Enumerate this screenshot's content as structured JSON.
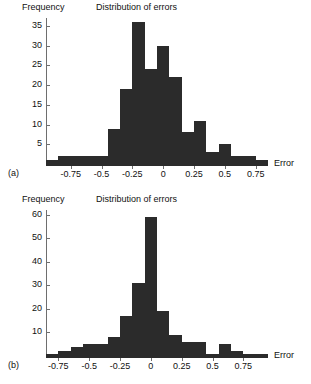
{
  "figure": {
    "ylabel": "Frequency",
    "xlabel": "Error",
    "panel_a_letter": "(a)",
    "panel_b_letter": "(b)",
    "bar_color": "#2b2b2b",
    "axis_color": "#6e6e6e",
    "background": "#ffffff"
  },
  "chart_data": [
    {
      "type": "bar",
      "panel": "(a)",
      "title": "Distribution of errors",
      "xlabel": "Error",
      "ylabel": "Frequency",
      "xlim": [
        -0.95,
        0.85
      ],
      "ylim": [
        0,
        37
      ],
      "xticks": [
        -0.75,
        -0.5,
        -0.25,
        0,
        0.25,
        0.5,
        0.75
      ],
      "xtick_labels": [
        "-0.75",
        "-0.5",
        "-0.25",
        "0",
        "0.25",
        "0.5",
        "0.75"
      ],
      "yticks": [
        5,
        10,
        15,
        20,
        25,
        30,
        35
      ],
      "ytick_labels": [
        "5",
        "10",
        "15",
        "20",
        "25",
        "30",
        "35"
      ],
      "grid": false,
      "legend": null,
      "bin_width": 0.1,
      "bin_left_edges": [
        -0.95,
        -0.85,
        -0.75,
        -0.65,
        -0.55,
        -0.45,
        -0.35,
        -0.25,
        -0.15,
        -0.05,
        0.05,
        0.15,
        0.25,
        0.35,
        0.45,
        0.55,
        0.65,
        0.75
      ],
      "categories": [
        "-0.95",
        "-0.85",
        "-0.75",
        "-0.65",
        "-0.55",
        "-0.45",
        "-0.35",
        "-0.25",
        "-0.15",
        "-0.05",
        "0.05",
        "0.15",
        "0.25",
        "0.35",
        "0.45",
        "0.55",
        "0.65",
        "0.75"
      ],
      "values": [
        1,
        2,
        2,
        2,
        2,
        9,
        19,
        36,
        24,
        30,
        22,
        8,
        11,
        3,
        5,
        2,
        2,
        1
      ]
    },
    {
      "type": "bar",
      "panel": "(b)",
      "title": "Distribution of errors",
      "xlabel": "Error",
      "ylabel": "Frequency",
      "xlim": [
        -0.85,
        0.95
      ],
      "ylim": [
        0,
        62
      ],
      "xticks": [
        -0.75,
        -0.5,
        -0.25,
        0,
        0.25,
        0.5,
        0.75
      ],
      "xtick_labels": [
        "-0.75",
        "-0.5",
        "-0.25",
        "0",
        "0.25",
        "0.5",
        "0.75"
      ],
      "yticks": [
        10,
        20,
        30,
        40,
        50,
        60
      ],
      "ytick_labels": [
        "10",
        "20",
        "30",
        "40",
        "50",
        "60"
      ],
      "grid": false,
      "legend": null,
      "bin_width": 0.1,
      "bin_left_edges": [
        -0.85,
        -0.75,
        -0.65,
        -0.55,
        -0.45,
        -0.35,
        -0.25,
        -0.15,
        -0.05,
        0.05,
        0.15,
        0.25,
        0.35,
        0.45,
        0.55,
        0.65,
        0.75,
        0.85
      ],
      "categories": [
        "-0.85",
        "-0.75",
        "-0.65",
        "-0.55",
        "-0.45",
        "-0.35",
        "-0.25",
        "-0.15",
        "-0.05",
        "0.05",
        "0.15",
        "0.25",
        "0.35",
        "0.45",
        "0.55",
        "0.65",
        "0.75",
        "0.85"
      ],
      "values": [
        1,
        2,
        4,
        5,
        5,
        8,
        17,
        31,
        59,
        19,
        9,
        6,
        6,
        1,
        5,
        2,
        1,
        1
      ]
    }
  ]
}
